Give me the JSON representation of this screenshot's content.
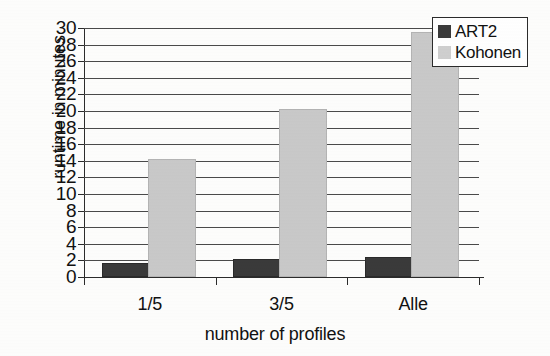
{
  "chart_data": {
    "type": "bar",
    "title": "",
    "subtitle": "",
    "xlabel": "number of profiles",
    "ylabel": "runtime in minutes",
    "categories": [
      "1/5",
      "3/5",
      "Alle"
    ],
    "series": [
      {
        "name": "ART2",
        "values": [
          1.5,
          1.9,
          2.2
        ],
        "color": "#3a3a3a"
      },
      {
        "name": "Kohonen",
        "values": [
          14,
          20,
          29.3
        ],
        "color": "#c9c9c9"
      }
    ],
    "ylim": [
      0,
      30
    ],
    "ytick_step": 2,
    "yticks": [
      0,
      2,
      4,
      6,
      8,
      10,
      12,
      14,
      16,
      18,
      20,
      22,
      24,
      26,
      28,
      30
    ],
    "ytick_labels": [
      "0",
      "2",
      "4",
      "6",
      "8",
      "10",
      "12",
      "14",
      "16",
      "18",
      "20",
      "22",
      "24",
      "26",
      "28",
      "30"
    ],
    "grid": true,
    "grid_axis": "y",
    "legend_position": "top-right",
    "legend_entries": [
      "ART2",
      "Kohonen"
    ],
    "bar_orientation": "vertical",
    "grouped": true
  },
  "legend": {
    "items": [
      {
        "label": "ART2",
        "color": "#3a3a3a"
      },
      {
        "label": "Kohonen",
        "color": "#cfcfcf"
      }
    ]
  },
  "axes": {
    "y_title": "runtime in minutes",
    "x_title": "number of profiles",
    "y_labels": [
      "30",
      "28",
      "26",
      "24",
      "22",
      "20",
      "18",
      "16",
      "14",
      "12",
      "10",
      "8",
      "6",
      "4",
      "2",
      "0"
    ],
    "x_labels": [
      "1/5",
      "3/5",
      "Alle"
    ]
  },
  "colors": {
    "background": "#fdfdfc",
    "axis": "#2b2b2b",
    "grid": "#4a4a4a",
    "series_art2": "#3a3a3a",
    "series_kohonen": "#c9c9c9"
  }
}
